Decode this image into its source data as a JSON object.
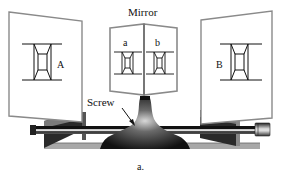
{
  "diagram": {
    "title_label": "Mirror",
    "screw_label": "Screw",
    "caption": "a.",
    "panels": {
      "left_label": "A",
      "right_label": "B"
    },
    "mirror_faces": {
      "left_label": "a",
      "right_label": "b"
    },
    "colors": {
      "background": "#ffffff",
      "panel_edge": "#888888",
      "block_face": "#6b6b6b",
      "block_dark": "#2a2a2a",
      "rod": "#1a1a1a",
      "rod_highlight": "#cfcfcf",
      "base_plate": "#9a9a9a",
      "stand": "#151515"
    }
  }
}
